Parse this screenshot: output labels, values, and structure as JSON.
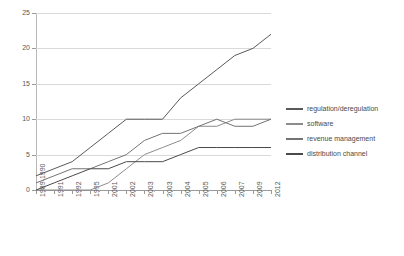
{
  "chart_data": {
    "type": "line",
    "title": "",
    "xlabel": "",
    "ylabel": "",
    "ylim": [
      0,
      25
    ],
    "yticks": [
      0,
      5,
      10,
      15,
      20,
      25
    ],
    "grid": true,
    "legend_position": "right",
    "categories": [
      "1989-1990",
      "1991",
      "1992",
      "1995",
      "2001",
      "2002",
      "2003",
      "2003",
      "2004",
      "2005",
      "2006",
      "2007",
      "2009",
      "2012"
    ],
    "series": [
      {
        "name": "regulation/deregulation",
        "color": "#595959",
        "values": [
          2,
          3,
          4,
          6,
          8,
          10,
          10,
          10,
          13,
          15,
          17,
          19,
          20,
          22
        ]
      },
      {
        "name": "software",
        "color": "#8c8c8c",
        "values": [
          0,
          0,
          0,
          0,
          1,
          3,
          5,
          6,
          7,
          9,
          9,
          10,
          10,
          10
        ]
      },
      {
        "name": "revenue management",
        "color": "#737373",
        "values": [
          1,
          2,
          3,
          3,
          4,
          5,
          7,
          8,
          8,
          9,
          10,
          9,
          9,
          10
        ]
      },
      {
        "name": "distribution channel",
        "color": "#4a4a4a",
        "values": [
          0,
          1,
          2,
          3,
          3,
          4,
          4,
          4,
          5,
          6,
          6,
          6,
          6,
          6
        ]
      }
    ]
  },
  "legend": {
    "items": [
      {
        "label": "regulation/deregulation",
        "color": "#595959"
      },
      {
        "label": "software",
        "color": "#8c8c8c"
      },
      {
        "label": "revenue management",
        "color": "#737373"
      },
      {
        "label": "distribution channel",
        "color": "#4a4a4a"
      }
    ]
  }
}
